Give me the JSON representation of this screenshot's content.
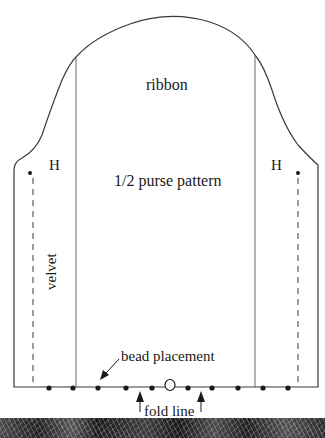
{
  "diagram": {
    "title": "1/2 purse pattern",
    "labels": {
      "ribbon": "ribbon",
      "pattern": "1/2 purse pattern",
      "hinge_left": "H",
      "hinge_right": "H",
      "velvet": "velvet",
      "bead_placement": "bead placement",
      "fold_line": "fold line"
    },
    "bead_positions_x": [
      49,
      73,
      98,
      126,
      152,
      188,
      212,
      238,
      263,
      288
    ],
    "center_marker_x": 170,
    "colors": {
      "line": "#3a3a3a",
      "text": "#1a1a1a",
      "background": "#ffffff",
      "fabric_strip": "#2a2a2a"
    }
  }
}
